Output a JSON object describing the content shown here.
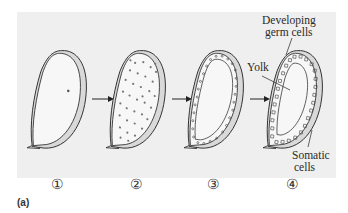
{
  "figure": {
    "caption": "(a)",
    "stages": [
      {
        "number": "①",
        "description": "egg with single nucleus"
      },
      {
        "number": "②",
        "description": "egg with many dividing nuclei"
      },
      {
        "number": "③",
        "description": "nuclei migrate to periphery forming cell layer"
      },
      {
        "number": "④",
        "description": "cellularized blastoderm"
      }
    ],
    "labels": {
      "developing_germ_cells_line1": "Developing",
      "developing_germ_cells_line2": "germ cells",
      "yolk": "Yolk",
      "somatic_cells_line1": "Somatic",
      "somatic_cells_line2": "cells"
    },
    "colors": {
      "panel_background": "#efefef",
      "egg_fill": "#f7f7f7",
      "shell_shade": "#d9d9d9",
      "line": "#2b2b2b"
    }
  }
}
